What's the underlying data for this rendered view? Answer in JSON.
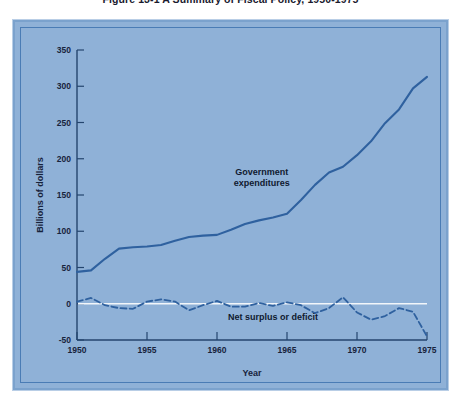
{
  "figure": {
    "caption": "Figure 13-1  A Summary of Fiscal Policy, 1950-1975"
  },
  "colors": {
    "panel_background": "#8fb1d7",
    "page_background": "#ffffff",
    "series_line": "#2f619f",
    "axis": "#24456e",
    "zero_reference_line": "#f2f6fa",
    "text": "#17233c"
  },
  "chart_data": {
    "type": "line",
    "title": "Figure 13-1  A Summary of Fiscal Policy, 1950-1975",
    "xlabel": "Year",
    "ylabel": "Billions of dollars",
    "xlim": [
      1950,
      1975
    ],
    "ylim": [
      -50,
      350
    ],
    "xticks": [
      1950,
      1955,
      1960,
      1965,
      1970,
      1975
    ],
    "xtick_labels": [
      "1950",
      "1955",
      "1960",
      "1965",
      "1970",
      "1975"
    ],
    "yticks": [
      -50,
      0,
      50,
      100,
      150,
      200,
      250,
      300,
      350
    ],
    "ytick_labels": [
      "-50",
      "0",
      "50",
      "100",
      "150",
      "200",
      "250",
      "300",
      "350"
    ],
    "grid": false,
    "legend": "none",
    "zero_reference_line": 0,
    "annotations": [
      {
        "text": "Government expenditures",
        "lines": [
          "Government",
          "expenditures"
        ],
        "x": 1963.2,
        "y": 178
      },
      {
        "text": "Net surplus or deficit",
        "lines": [
          "Net surplus or deficit"
        ],
        "x": 1964.0,
        "y": -22
      }
    ],
    "x": [
      1950,
      1951,
      1952,
      1953,
      1954,
      1955,
      1956,
      1957,
      1958,
      1959,
      1960,
      1961,
      1962,
      1963,
      1964,
      1965,
      1966,
      1967,
      1968,
      1969,
      1970,
      1971,
      1972,
      1973,
      1974,
      1975
    ],
    "series": [
      {
        "name": "Government expenditures",
        "style": "solid",
        "values": [
          44,
          46,
          62,
          76,
          78,
          79,
          81,
          87,
          92,
          94,
          95,
          102,
          110,
          115,
          119,
          124,
          143,
          164,
          181,
          189,
          205,
          224,
          249,
          268,
          297,
          313
        ]
      },
      {
        "name": "Net surplus or deficit",
        "style": "dashed",
        "values": [
          3,
          8,
          -2,
          -6,
          -7,
          3,
          6,
          3,
          -9,
          -2,
          4,
          -4,
          -4,
          1,
          -3,
          2,
          -2,
          -13,
          -6,
          9,
          -12,
          -22,
          -17,
          -6,
          -11,
          -45
        ]
      }
    ]
  }
}
